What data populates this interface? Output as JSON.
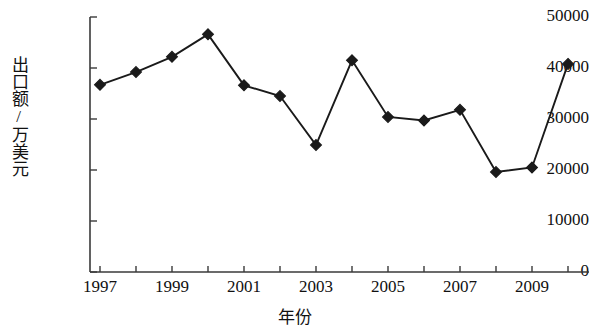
{
  "chart_data": {
    "type": "line",
    "title": "",
    "subtitle": "",
    "xlabel": "年份",
    "ylabel": "出口额/万美元",
    "x": [
      1997,
      1998,
      1999,
      2000,
      2001,
      2002,
      2003,
      2004,
      2005,
      2006,
      2007,
      2008,
      2009,
      2010
    ],
    "categories": [
      "1997",
      "1998",
      "1999",
      "2000",
      "2001",
      "2002",
      "2003",
      "2004",
      "2005",
      "2006",
      "2007",
      "2008",
      "2009",
      "2010"
    ],
    "values": [
      36700,
      39200,
      42200,
      46600,
      36600,
      34500,
      24900,
      41500,
      30400,
      29700,
      31800,
      19600,
      20500,
      40800
    ],
    "series": [
      {
        "name": "出口额",
        "values": [
          36700,
          39200,
          42200,
          46600,
          36600,
          34500,
          24900,
          41500,
          30400,
          29700,
          31800,
          19600,
          20500,
          40800
        ]
      }
    ],
    "ylim": [
      0,
      50000
    ],
    "xlim": [
      1997,
      2010
    ],
    "y_ticks": [
      0,
      10000,
      20000,
      30000,
      40000,
      50000
    ],
    "y_tick_labels": [
      "0",
      "10000",
      "20000",
      "30000",
      "40000",
      "50000"
    ],
    "x_ticks": [
      1997,
      1998,
      1999,
      2000,
      2001,
      2002,
      2003,
      2004,
      2005,
      2006,
      2007,
      2008,
      2009,
      2010
    ],
    "x_tick_labels_shown": [
      "1997",
      "1999",
      "2001",
      "2003",
      "2005",
      "2007",
      "2009"
    ],
    "grid": false,
    "legend": false,
    "legend_position": "none",
    "marker": "diamond",
    "line_color": "#1a1a1a",
    "marker_color": "#1a1a1a",
    "background_color": "#ffffff",
    "axis_color": "#3a3a3a"
  },
  "axes": {
    "y_labels": [
      "50000",
      "40000",
      "30000",
      "20000",
      "10000",
      "0"
    ],
    "y_title": "出口额/万美元",
    "x_labels": [
      "1997",
      "1999",
      "2001",
      "2003",
      "2005",
      "2007",
      "2009"
    ],
    "x_title": "年份"
  }
}
